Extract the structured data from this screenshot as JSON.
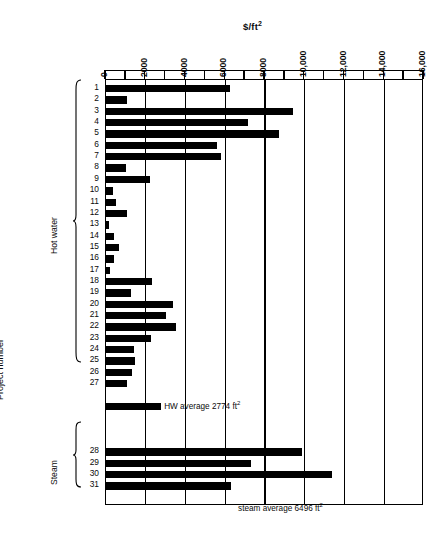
{
  "chart_data": {
    "type": "bar",
    "orientation": "horizontal",
    "title": "$/ft2",
    "title_display": "$/ft",
    "title_sup": "2",
    "xlabel": "$/ft2",
    "ylabel": "Project number",
    "xlim": [
      0,
      16000
    ],
    "grid": true,
    "grid_interval": 2000,
    "tick_interval": 1000,
    "legend": "none",
    "xticks": [
      0,
      2000,
      4000,
      6000,
      8000,
      10000,
      12000,
      14000,
      16000
    ],
    "xtick_labels": [
      "0",
      "2000",
      "4000",
      "6000",
      "8000",
      "10,000",
      "12,000",
      "14,000",
      "16,000"
    ],
    "categories": [
      "1",
      "2",
      "3",
      "4",
      "5",
      "6",
      "7",
      "8",
      "9",
      "10",
      "11",
      "12",
      "13",
      "14",
      "15",
      "16",
      "17",
      "18",
      "19",
      "20",
      "21",
      "22",
      "23",
      "24",
      "25",
      "26",
      "27",
      "28",
      "29",
      "30",
      "31"
    ],
    "values": [
      6250,
      1050,
      9400,
      7150,
      8700,
      5600,
      5800,
      1000,
      2200,
      350,
      500,
      1050,
      150,
      400,
      650,
      400,
      200,
      2300,
      1250,
      3350,
      3000,
      3500,
      2250,
      1400,
      1450,
      1300,
      1050,
      9850,
      7300,
      11350,
      6300
    ],
    "groups": [
      {
        "name": "Hot water",
        "categories": [
          "1",
          "2",
          "3",
          "4",
          "5",
          "6",
          "7",
          "8",
          "9",
          "10",
          "11",
          "12",
          "13",
          "14",
          "15",
          "16",
          "17",
          "18",
          "19",
          "20",
          "21",
          "22",
          "23",
          "24",
          "25",
          "26",
          "27"
        ]
      },
      {
        "name": "Steam",
        "categories": [
          "28",
          "29",
          "30",
          "31"
        ]
      }
    ],
    "summary_bars": [
      {
        "label": "HW average 2774 ft",
        "label_sup": "2",
        "value": 2774,
        "group": "Hot water"
      },
      {
        "label": "steam average 6496 ft",
        "label_sup": "2",
        "value": 6496,
        "group": "Steam"
      }
    ],
    "annotations": [
      "HW average 2774 ft2",
      "steam average 6496 ft2"
    ],
    "colors": {
      "bar": "#000000",
      "grid": "#000000",
      "background": "#ffffff"
    }
  },
  "axes": {
    "y_axis_title": "Project number",
    "x_axis_title": "$/ft"
  }
}
